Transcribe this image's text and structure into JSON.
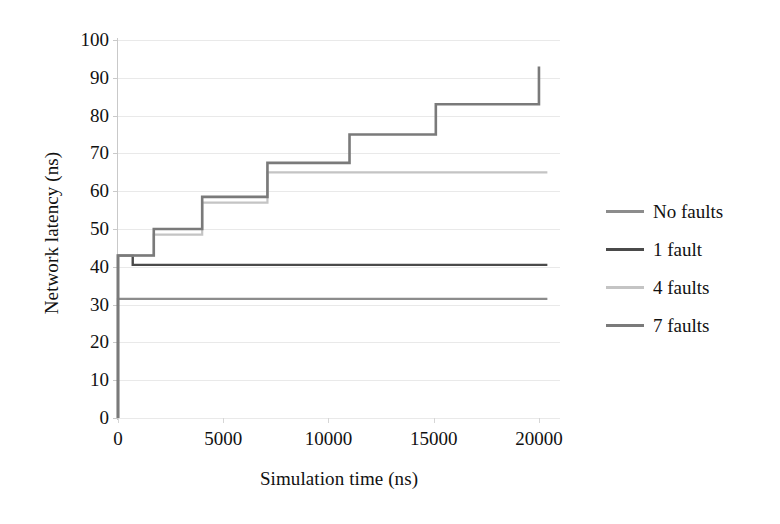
{
  "chart_data": {
    "type": "line",
    "subtype": "step",
    "title": "",
    "xlabel": "Simulation time (ns)",
    "ylabel": "Network latency (ns)",
    "xlim": [
      0,
      21000
    ],
    "ylim": [
      0,
      100
    ],
    "xticks": [
      0,
      5000,
      10000,
      15000,
      20000
    ],
    "xtick_labels": [
      "0",
      "5000",
      "10000",
      "15000",
      "20000"
    ],
    "yticks": [
      0,
      10,
      20,
      30,
      40,
      50,
      60,
      70,
      80,
      90,
      100
    ],
    "ytick_labels": [
      "0",
      "10",
      "20",
      "30",
      "40",
      "50",
      "60",
      "70",
      "80",
      "90",
      "100"
    ],
    "grid": "horizontal",
    "legend_position": "right",
    "series": [
      {
        "name": "No faults",
        "color": "#8c8c8c",
        "width": 2.2,
        "points": [
          [
            0,
            0
          ],
          [
            0,
            31.5
          ],
          [
            20400,
            31.5
          ]
        ]
      },
      {
        "name": "1 fault",
        "color": "#4a4a4a",
        "width": 2.4,
        "points": [
          [
            0,
            0
          ],
          [
            0,
            43
          ],
          [
            700,
            43
          ],
          [
            700,
            40.5
          ],
          [
            20400,
            40.5
          ]
        ]
      },
      {
        "name": "4 faults",
        "color": "#c4c4c4",
        "width": 2.2,
        "points": [
          [
            0,
            0
          ],
          [
            0,
            43
          ],
          [
            1700,
            43
          ],
          [
            1700,
            48.5
          ],
          [
            4000,
            48.5
          ],
          [
            4000,
            57
          ],
          [
            7100,
            57
          ],
          [
            7100,
            65
          ],
          [
            20400,
            65
          ]
        ]
      },
      {
        "name": "7 faults",
        "color": "#7a7a7a",
        "width": 2.6,
        "points": [
          [
            0,
            0
          ],
          [
            0,
            43
          ],
          [
            1700,
            43
          ],
          [
            1700,
            50
          ],
          [
            4000,
            50
          ],
          [
            4000,
            58.5
          ],
          [
            7100,
            58.5
          ],
          [
            7100,
            67.5
          ],
          [
            11000,
            67.5
          ],
          [
            11000,
            75
          ],
          [
            15100,
            75
          ],
          [
            15100,
            83
          ],
          [
            20000,
            83
          ],
          [
            20000,
            93
          ]
        ]
      }
    ]
  },
  "legend": {
    "items": [
      {
        "label": "No faults",
        "color": "#8c8c8c"
      },
      {
        "label": "1 fault",
        "color": "#4a4a4a"
      },
      {
        "label": "4 faults",
        "color": "#c4c4c4"
      },
      {
        "label": "7 faults",
        "color": "#7a7a7a"
      }
    ]
  }
}
